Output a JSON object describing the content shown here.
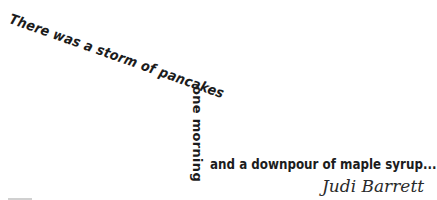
{
  "quote": {
    "line1": "There was a storm of pancakes",
    "line2": "one morning",
    "line3": "and a downpour of maple syrup...",
    "author": "Judi Barrett"
  },
  "colors": {
    "text": "#1c1c1c",
    "background": "#ffffff"
  }
}
